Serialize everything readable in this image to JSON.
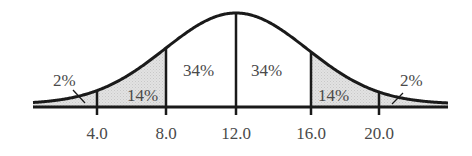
{
  "chart_data": {
    "type": "area",
    "title": "",
    "xlabel": "",
    "ylabel": "",
    "x_ticks": [
      "4.0",
      "8.0",
      "12.0",
      "16.0",
      "20.0"
    ],
    "mean": 12.0,
    "std_dev": 4.0,
    "regions": [
      {
        "from": null,
        "to": 4.0,
        "percent": "2%",
        "shaded": true
      },
      {
        "from": 4.0,
        "to": 8.0,
        "percent": "14%",
        "shaded": true
      },
      {
        "from": 8.0,
        "to": 12.0,
        "percent": "34%",
        "shaded": false
      },
      {
        "from": 12.0,
        "to": 16.0,
        "percent": "34%",
        "shaded": false
      },
      {
        "from": 16.0,
        "to": 20.0,
        "percent": "14%",
        "shaded": true
      },
      {
        "from": 20.0,
        "to": null,
        "percent": "2%",
        "shaded": true
      }
    ],
    "grid": false,
    "legend": null
  },
  "labels": {
    "left_tail": "2%",
    "left_mid": "14%",
    "left_center": "34%",
    "right_center": "34%",
    "right_mid": "14%",
    "right_tail": "2%"
  },
  "ticks": {
    "t1": "4.0",
    "t2": "8.0",
    "t3": "12.0",
    "t4": "16.0",
    "t5": "20.0"
  },
  "colors": {
    "curve": "#1a1a1a",
    "shade": "#d9d9d9",
    "text": "#4a4a4a"
  }
}
